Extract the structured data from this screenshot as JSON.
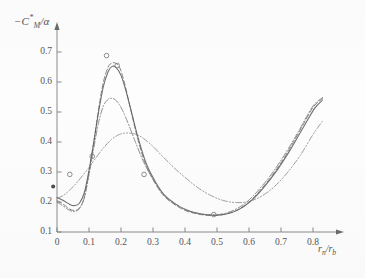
{
  "chart_data": {
    "type": "line",
    "title": "",
    "xlabel": "r_n/r_b",
    "ylabel": "-C*_M/alpha",
    "xlabel_display": "r",
    "xlabel_sub1": "n",
    "xlabel_mid": "/r",
    "xlabel_sub2": "b",
    "ylabel_display": "−C",
    "ylabel_sup": "*",
    "ylabel_sub": "M",
    "ylabel_tail": "/α",
    "xlim": [
      0.0,
      0.85
    ],
    "ylim": [
      0.1,
      0.75
    ],
    "grid": false,
    "legend": "none",
    "xticks": [
      0,
      0.1,
      0.2,
      0.3,
      0.4,
      0.5,
      0.6,
      0.7,
      0.8
    ],
    "xtick_labels": [
      "0",
      "0.1",
      "0.2",
      "0.3",
      "0.4",
      "0.5",
      "0.6",
      "0.7",
      "0.8"
    ],
    "yticks": [
      0.1,
      0.2,
      0.3,
      0.4,
      0.5,
      0.6,
      0.7
    ],
    "ytick_labels": [
      "0.1",
      "0.2",
      "0.3",
      "0.4",
      "0.5",
      "0.6",
      "0.7"
    ],
    "axis_arrow_x": "right",
    "axis_arrow_y": "down",
    "series": [
      {
        "name": "curve-dashed-upper",
        "style": "dashed",
        "color": "#6f6f6f",
        "x": [
          0.0,
          0.02,
          0.04,
          0.055,
          0.07,
          0.085,
          0.1,
          0.115,
          0.13,
          0.145,
          0.16,
          0.17,
          0.18,
          0.195,
          0.21,
          0.23,
          0.25,
          0.275,
          0.3,
          0.33,
          0.36,
          0.4,
          0.44,
          0.48,
          0.52,
          0.56,
          0.6,
          0.64,
          0.68,
          0.72,
          0.76,
          0.8,
          0.83
        ],
        "y": [
          0.205,
          0.192,
          0.176,
          0.172,
          0.18,
          0.215,
          0.3,
          0.4,
          0.51,
          0.6,
          0.65,
          0.662,
          0.664,
          0.65,
          0.6,
          0.51,
          0.42,
          0.33,
          0.275,
          0.225,
          0.197,
          0.172,
          0.16,
          0.155,
          0.158,
          0.172,
          0.2,
          0.245,
          0.3,
          0.365,
          0.44,
          0.515,
          0.545
        ]
      },
      {
        "name": "curve-solid-main",
        "style": "solid",
        "color": "#5a5a5a",
        "x": [
          0.0,
          0.02,
          0.04,
          0.055,
          0.07,
          0.085,
          0.1,
          0.115,
          0.13,
          0.145,
          0.16,
          0.172,
          0.185,
          0.2,
          0.215,
          0.235,
          0.255,
          0.28,
          0.305,
          0.335,
          0.365,
          0.405,
          0.445,
          0.485,
          0.525,
          0.565,
          0.605,
          0.645,
          0.685,
          0.725,
          0.765,
          0.805,
          0.83
        ],
        "y": [
          0.215,
          0.205,
          0.192,
          0.188,
          0.196,
          0.23,
          0.305,
          0.4,
          0.5,
          0.585,
          0.635,
          0.652,
          0.648,
          0.622,
          0.572,
          0.49,
          0.408,
          0.325,
          0.272,
          0.224,
          0.197,
          0.173,
          0.161,
          0.156,
          0.159,
          0.173,
          0.202,
          0.247,
          0.302,
          0.367,
          0.44,
          0.512,
          0.54
        ]
      },
      {
        "name": "curve-dashdot-mid",
        "style": "dashdot",
        "color": "#7a7a7a",
        "x": [
          0.0,
          0.02,
          0.04,
          0.055,
          0.07,
          0.085,
          0.1,
          0.115,
          0.13,
          0.145,
          0.16,
          0.175,
          0.19,
          0.205,
          0.225,
          0.245,
          0.27,
          0.295,
          0.325,
          0.355,
          0.395,
          0.435,
          0.475,
          0.515,
          0.555,
          0.595,
          0.635,
          0.675,
          0.715,
          0.755,
          0.8,
          0.83
        ],
        "y": [
          0.2,
          0.186,
          0.172,
          0.168,
          0.178,
          0.212,
          0.29,
          0.38,
          0.465,
          0.52,
          0.542,
          0.545,
          0.532,
          0.505,
          0.455,
          0.4,
          0.335,
          0.285,
          0.235,
          0.205,
          0.178,
          0.164,
          0.158,
          0.16,
          0.174,
          0.202,
          0.246,
          0.3,
          0.364,
          0.436,
          0.52,
          0.548
        ]
      },
      {
        "name": "curve-dashdot-lower",
        "style": "dashdotdot",
        "color": "#8a8a8a",
        "x": [
          0.0,
          0.02,
          0.04,
          0.06,
          0.08,
          0.1,
          0.12,
          0.145,
          0.17,
          0.195,
          0.22,
          0.245,
          0.27,
          0.3,
          0.33,
          0.365,
          0.4,
          0.44,
          0.48,
          0.52,
          0.56,
          0.6,
          0.64,
          0.68,
          0.72,
          0.76,
          0.8,
          0.83
        ],
        "y": [
          0.212,
          0.222,
          0.24,
          0.262,
          0.288,
          0.315,
          0.345,
          0.38,
          0.408,
          0.425,
          0.43,
          0.426,
          0.412,
          0.385,
          0.352,
          0.315,
          0.282,
          0.248,
          0.222,
          0.205,
          0.198,
          0.202,
          0.22,
          0.252,
          0.298,
          0.355,
          0.425,
          0.47
        ]
      }
    ],
    "markers": [
      {
        "name": "marker-open-circle",
        "x": 0.04,
        "y": 0.292,
        "filled": false
      },
      {
        "name": "marker-open-circle",
        "x": 0.11,
        "y": 0.352,
        "filled": false
      },
      {
        "name": "marker-open-circle",
        "x": 0.155,
        "y": 0.688,
        "filled": false
      },
      {
        "name": "marker-open-circle",
        "x": 0.188,
        "y": 0.655,
        "filled": false
      },
      {
        "name": "marker-open-circle",
        "x": 0.272,
        "y": 0.292,
        "filled": false
      },
      {
        "name": "marker-open-circle",
        "x": 0.49,
        "y": 0.158,
        "filled": false
      },
      {
        "name": "marker-filled-dot",
        "x": -0.012,
        "y": 0.252,
        "filled": true
      }
    ]
  }
}
